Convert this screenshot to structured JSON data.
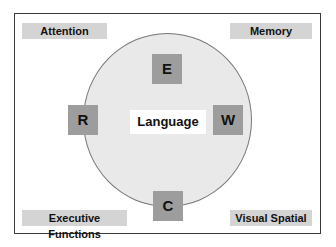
{
  "diagram": {
    "center": {
      "label": "Language"
    },
    "nodes": {
      "top": "E",
      "left": "R",
      "right": "W",
      "bottom": "C"
    },
    "corners": {
      "top_left": "Attention",
      "top_right": "Memory",
      "bottom_left": "Executive Functions",
      "bottom_right": "Visual Spatial"
    },
    "colors": {
      "circle_fill": "#e9e9e9",
      "node_fill": "#9d9d9d",
      "corner_fill": "#d4d4d4",
      "frame_border": "#3a3a3a"
    }
  }
}
